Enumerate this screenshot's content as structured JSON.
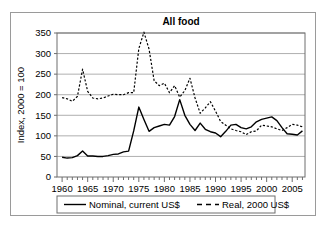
{
  "chart_data": {
    "type": "line",
    "title": "All food",
    "xlabel": "",
    "ylabel": "Index, 2000 = 100",
    "xlim": [
      1959,
      2007.5
    ],
    "ylim": [
      0,
      350
    ],
    "yticks": [
      0,
      50,
      100,
      150,
      200,
      250,
      300,
      350
    ],
    "ytick_labels": [
      "0",
      "50",
      "100",
      "150",
      "200",
      "250",
      "300",
      "350"
    ],
    "xticks": [
      1960,
      1965,
      1970,
      1975,
      1980,
      1985,
      1990,
      1995,
      2000,
      2005
    ],
    "xtick_labels": [
      "1960",
      "1965",
      "1970",
      "1975",
      "1980",
      "1985",
      "1990",
      "1995",
      "2000",
      "2005"
    ],
    "minor_xtick_interval": 1,
    "grid": "horizontal",
    "legend_position": "bottom",
    "x": [
      1960,
      1961,
      1962,
      1963,
      1964,
      1965,
      1966,
      1967,
      1968,
      1969,
      1970,
      1971,
      1972,
      1973,
      1974,
      1975,
      1976,
      1977,
      1978,
      1979,
      1980,
      1981,
      1982,
      1983,
      1984,
      1985,
      1986,
      1987,
      1988,
      1989,
      1990,
      1991,
      1992,
      1993,
      1994,
      1995,
      1996,
      1997,
      1998,
      1999,
      2000,
      2001,
      2002,
      2003,
      2004,
      2005,
      2006,
      2007
    ],
    "series": [
      {
        "name": "Nominal, current US$",
        "style": "solid",
        "color": "#000000",
        "values": [
          48,
          46,
          47,
          52,
          63,
          51,
          51,
          50,
          50,
          52,
          55,
          56,
          61,
          63,
          112,
          170,
          140,
          111,
          120,
          124,
          128,
          126,
          147,
          188,
          150,
          128,
          113,
          131,
          116,
          110,
          107,
          98,
          111,
          126,
          128,
          120,
          117,
          122,
          134,
          140,
          143,
          146,
          137,
          120,
          105,
          104,
          102,
          112
        ]
      },
      {
        "name": "Real, 2000 US$",
        "style": "dashed",
        "color": "#000000",
        "values": [
          193,
          190,
          184,
          196,
          262,
          208,
          192,
          190,
          192,
          197,
          201,
          200,
          200,
          205,
          205,
          312,
          352,
          311,
          234,
          222,
          228,
          205,
          222,
          194,
          210,
          240,
          192,
          155,
          168,
          183,
          160,
          135,
          126,
          117,
          113,
          110,
          103,
          110,
          112,
          126,
          124,
          122,
          117,
          113,
          120,
          128,
          126,
          122
        ]
      }
    ],
    "series_corrected": {
      "note": "values read off gridlines",
      "nominal": [
        48,
        46,
        47,
        52,
        63,
        51,
        51,
        50,
        50,
        52,
        55,
        56,
        61,
        63,
        112,
        170,
        140,
        111,
        120,
        124,
        128,
        126,
        147,
        188,
        150,
        128,
        113,
        131,
        116,
        110,
        107,
        98,
        111,
        126,
        128,
        120,
        117,
        122,
        134,
        140,
        143,
        146,
        137,
        120,
        105,
        104,
        102,
        112
      ],
      "real": [
        193,
        190,
        184,
        196,
        262,
        208,
        192,
        190,
        192,
        197,
        201,
        200,
        200,
        205,
        205,
        312,
        352,
        311,
        234,
        222,
        228,
        205,
        222,
        194,
        210,
        240,
        192,
        155,
        168,
        183,
        160,
        135,
        126,
        117,
        113,
        110,
        103,
        110,
        112,
        126,
        124,
        122,
        117,
        113,
        120,
        128,
        126,
        122
      ]
    }
  },
  "legend": {
    "entries": [
      {
        "label": "Nominal, current US$",
        "style": "solid"
      },
      {
        "label": "Real, 2000 US$",
        "style": "dashed"
      }
    ]
  }
}
